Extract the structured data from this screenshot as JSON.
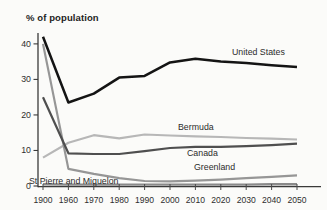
{
  "chart_data": {
    "type": "line",
    "title": "% of population",
    "xlabel": "",
    "ylabel": "% of population",
    "x": [
      1900,
      1960,
      1970,
      1980,
      1990,
      2000,
      2010,
      2020,
      2030,
      2040,
      2050
    ],
    "yticks": [
      0,
      10,
      20,
      30,
      40
    ],
    "ylim": [
      0,
      43
    ],
    "grid": false,
    "legend_position": "inline-labels",
    "axis_color": "#3a3a3a",
    "tick_label_color": "#2e2e2e",
    "series": [
      {
        "name": "Bermuda",
        "color": "#b7b7b7",
        "width": 2.2,
        "values": [
          8,
          12.2,
          14.3,
          13.4,
          14.5,
          14.2,
          14,
          13.8,
          13.5,
          13.3,
          13.1
        ],
        "label_x": 178,
        "label_y": 130
      },
      {
        "name": "Greenland",
        "color": "#969696",
        "width": 2.2,
        "values": [
          40,
          4.8,
          3.4,
          2.2,
          1.4,
          1.3,
          1.5,
          1.8,
          2.2,
          2.6,
          3
        ],
        "label_x": 194,
        "label_y": 170
      },
      {
        "name": "Canada",
        "color": "#4f4f4f",
        "width": 2.2,
        "values": [
          25,
          9.2,
          9,
          9,
          9.8,
          10.7,
          11,
          11,
          11.2,
          11.5,
          11.9
        ],
        "label_x": 187,
        "label_y": 156
      },
      {
        "name": "St Pierre and Miquelon",
        "color": "#8a8a8a",
        "width": 2.4,
        "values": [
          0.5,
          0.4,
          0.4,
          0.4,
          0.4,
          0.4,
          0.4,
          0.4,
          0.4,
          0.5,
          0.5
        ],
        "label_x": 29,
        "label_y": 184
      },
      {
        "name": "United States",
        "color": "#141414",
        "width": 2.5,
        "values": [
          42,
          23.5,
          26,
          30.5,
          31,
          34.8,
          35.8,
          35,
          34.6,
          34,
          33.5
        ],
        "label_x": 232,
        "label_y": 55
      }
    ]
  }
}
